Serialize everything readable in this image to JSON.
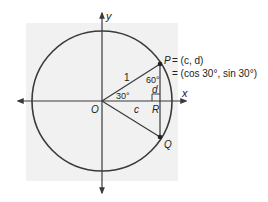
{
  "diagram": {
    "type": "unit-circle",
    "colors": {
      "background_panel": "#f1f1f1",
      "stroke": "#3a3a3a",
      "text": "#222222"
    },
    "axes": {
      "x_label": "x",
      "y_label": "y"
    },
    "points": {
      "origin": "O",
      "p": "P",
      "q": "Q",
      "r": "R"
    },
    "equation": {
      "line1": "= (c, d)",
      "line2": "= (cos 30°, sin 30°)"
    },
    "labels": {
      "radius": "1",
      "angle_origin": "30°",
      "angle_p": "60°",
      "side_d": "d",
      "side_c": "c"
    }
  }
}
